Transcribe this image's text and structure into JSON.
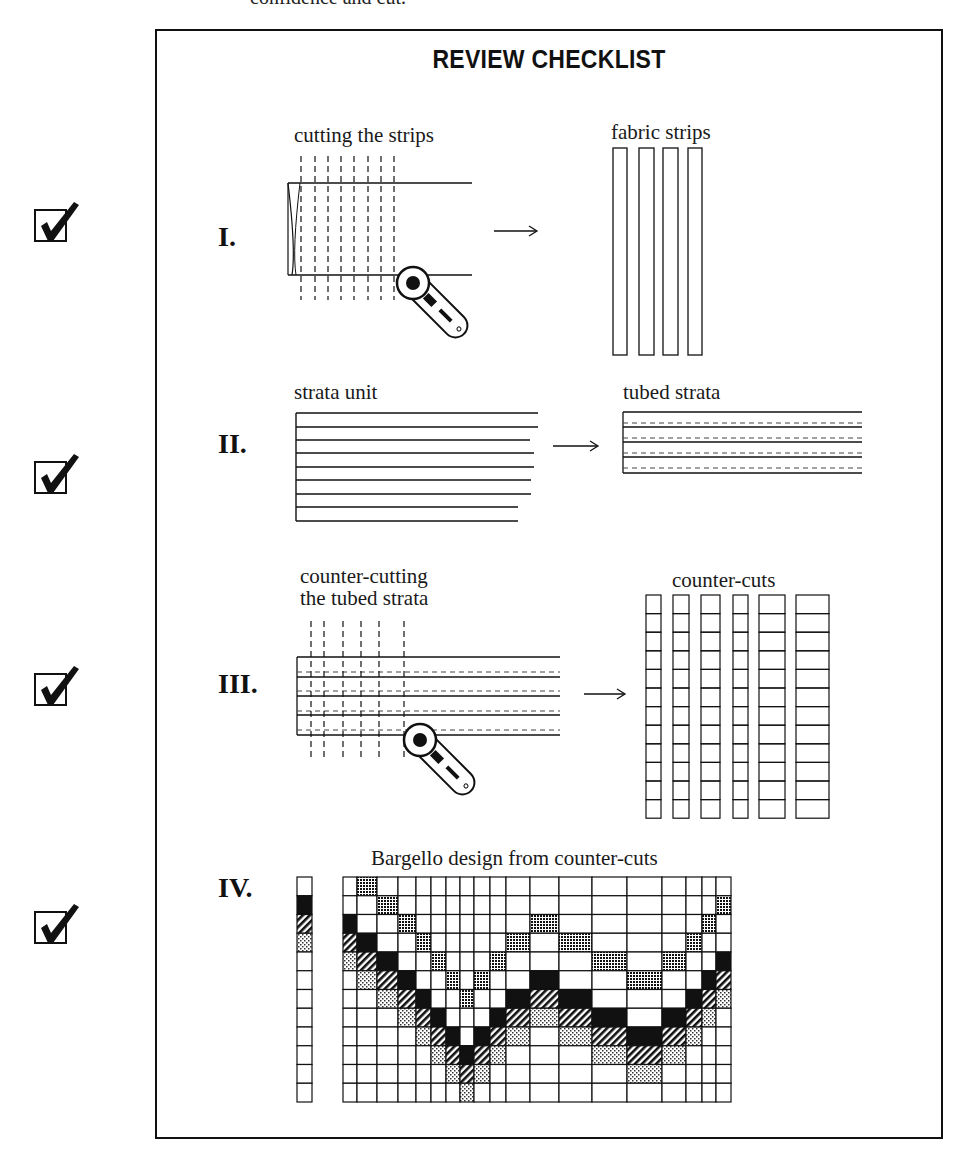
{
  "page": {
    "top_text_fragment": "confidence and cut.",
    "title": "REVIEW CHECKLIST"
  },
  "checkmarks": [
    {
      "label": "checked",
      "state": true
    },
    {
      "label": "checked",
      "state": true
    },
    {
      "label": "checked",
      "state": true
    },
    {
      "label": "checked",
      "state": true
    }
  ],
  "steps": [
    {
      "numeral": "I.",
      "left_caption": "cutting the strips",
      "right_caption": "fabric strips",
      "dashed_cut_lines": 8,
      "strip_count": 4
    },
    {
      "numeral": "II.",
      "left_caption": "strata unit",
      "right_caption": "tubed strata",
      "strata_lines": 9,
      "tube_seams": 4
    },
    {
      "numeral": "III.",
      "left_caption_line1": "counter-cutting",
      "left_caption_line2": "the tubed strata",
      "right_caption": "counter-cuts",
      "dashed_cut_lines": 6,
      "counter_cut_columns": 6,
      "segments_per_column": 12
    },
    {
      "numeral": "IV.",
      "caption": "Bargello design from counter-cuts",
      "grid_rows": 12,
      "grid_columns": 19
    }
  ],
  "bargello": {
    "legend_strip": [
      "white",
      "black",
      "hatch",
      "light-dots",
      "white",
      "white",
      "white",
      "white",
      "white",
      "white",
      "white",
      "white"
    ],
    "fills": {
      "D": "dark-dots",
      "B": "black",
      "H": "hatch",
      "L": "light-dots"
    },
    "column_x": [
      343,
      357,
      377,
      398,
      416,
      431,
      446,
      460,
      474,
      490,
      506,
      530,
      559,
      592,
      627,
      662,
      686,
      702,
      716,
      731
    ],
    "top_row_per_column": [
      -1,
      0,
      1,
      2,
      3,
      4,
      5,
      6,
      5,
      4,
      3,
      2,
      3,
      4,
      5,
      4,
      3,
      2,
      1
    ]
  }
}
